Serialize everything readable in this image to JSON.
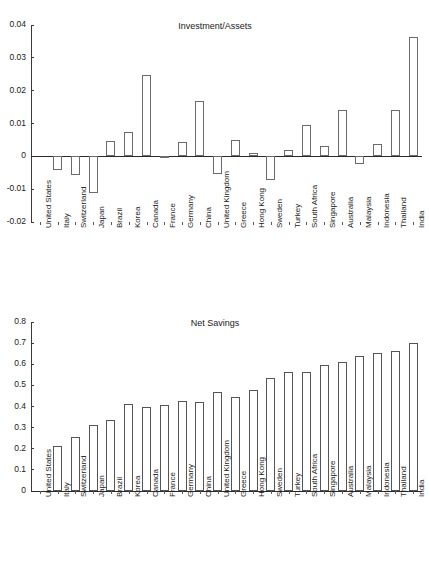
{
  "figure": {
    "background": "#ffffff",
    "axis_color": "#3a3a3a",
    "bar_edge_color": "#6b6b6b",
    "bar_fill_color": "#ffffff"
  },
  "chart_data": [
    {
      "type": "bar",
      "title": "Investment/Assets",
      "xlabel": "",
      "ylabel": "",
      "ylim": [
        -0.02,
        0.04
      ],
      "yticks": [
        0.04,
        0.03,
        0.02,
        0.01,
        0,
        -0.01,
        -0.02
      ],
      "ytick_labels": [
        "0.04",
        "0.03",
        "0.02",
        "0.01",
        "0",
        "-0.01",
        "-0.02"
      ],
      "grid": false,
      "legend": "none",
      "zero_line": 0,
      "categories": [
        "United States",
        "Italy",
        "Switzerland",
        "Japan",
        "Brazil",
        "Korea",
        "Canada",
        "France",
        "Germany",
        "China",
        "United Kingdom",
        "Greece",
        "Hong Kong",
        "Sweden",
        "Turkey",
        "South Africa",
        "Singapore",
        "Australia",
        "Malaysia",
        "Indonesia",
        "Thailand",
        "India"
      ],
      "values": [
        0.0,
        -0.0042,
        -0.0056,
        -0.0113,
        0.0048,
        0.0075,
        0.0247,
        0.0002,
        0.0043,
        0.017,
        -0.0054,
        0.0051,
        0.0009,
        -0.0072,
        0.0019,
        0.0095,
        0.0031,
        0.0141,
        -0.0023,
        0.0037,
        0.0141,
        0.0363
      ]
    },
    {
      "type": "bar",
      "title": "Net Savings",
      "xlabel": "",
      "ylabel": "",
      "ylim": [
        0,
        0.8
      ],
      "yticks": [
        0.8,
        0.7,
        0.6,
        0.5,
        0.4,
        0.3,
        0.2,
        0.1,
        0
      ],
      "ytick_labels": [
        "0.8",
        "0.7",
        "0.6",
        "0.5",
        "0.4",
        "0.3",
        "0.2",
        "0.1",
        "0"
      ],
      "grid": false,
      "legend": "none",
      "zero_line": 0,
      "categories": [
        "United States",
        "Italy",
        "Switzerland",
        "Japan",
        "Brazil",
        "Korea",
        "Canada",
        "France",
        "Germany",
        "China",
        "United Kingdom",
        "Greece",
        "Hong Kong",
        "Sweden",
        "Turkey",
        "South Africa",
        "Singapore",
        "Australia",
        "Malaysia",
        "Indonesia",
        "Thailand",
        "India"
      ],
      "values": [
        0.0,
        0.214,
        0.256,
        0.311,
        0.336,
        0.411,
        0.398,
        0.407,
        0.425,
        0.42,
        0.467,
        0.446,
        0.478,
        0.537,
        0.563,
        0.562,
        0.598,
        0.612,
        0.638,
        0.655,
        0.663,
        0.701
      ]
    }
  ]
}
